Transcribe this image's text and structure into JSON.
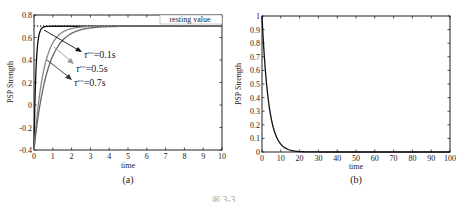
{
  "chart_data": [
    {
      "panel": "(a)",
      "type": "line",
      "title": "",
      "xlabel": "time",
      "ylabel": "PSP Strength",
      "xlim": [
        0,
        10
      ],
      "ylim": [
        -0.4,
        0.8
      ],
      "xticks": [
        "0",
        "1",
        "2",
        "3",
        "4",
        "5",
        "6",
        "7",
        "8",
        "9",
        "10"
      ],
      "yticks": [
        "-0.4",
        "-0.2",
        "0",
        "0.2",
        "0.4",
        "0.6",
        "0.8"
      ],
      "grid": false,
      "reference_line": {
        "label": "resting value",
        "y": 0.7,
        "style": "dotted"
      },
      "series": [
        {
          "name": "τ^rec=0.1s",
          "color": "#111111",
          "start": -0.4,
          "end": 0.7,
          "tau": 0.1
        },
        {
          "name": "τ^rec=0.5s",
          "color": "#888888",
          "start": -0.4,
          "end": 0.7,
          "tau": 0.5
        },
        {
          "name": "τ^rec=0.7s",
          "color": "#666666",
          "start": -0.4,
          "end": 0.7,
          "tau": 0.7
        }
      ],
      "annotations": [
        {
          "text": "τ^rec=0.1s"
        },
        {
          "text": "τ^rec=0.5s"
        },
        {
          "text": "τ^rec=0.7s"
        }
      ]
    },
    {
      "panel": "(b)",
      "type": "line",
      "title": "",
      "xlabel": "time",
      "ylabel": "PSP Strength",
      "xlim": [
        0,
        100
      ],
      "ylim": [
        0,
        1
      ],
      "xticks": [
        "0",
        "10",
        "20",
        "30",
        "40",
        "50",
        "60",
        "70",
        "80",
        "90",
        "100"
      ],
      "yticks": [
        "0",
        "0.1",
        "0.2",
        "0.3",
        "0.4",
        "0.5",
        "0.6",
        "0.7",
        "0.8",
        "0.9",
        "1"
      ],
      "grid": false,
      "series": [
        {
          "name": "decay",
          "color": "#111111",
          "start": 1.0,
          "end": 0.0,
          "tau": 3.5
        }
      ]
    }
  ],
  "labels": {
    "panel_a": "(a)",
    "panel_b": "(b)",
    "xlabel": "time",
    "ylabel": "PSP Strength",
    "resting": "resting value",
    "anno1_base": "τ",
    "anno1_sup": "rec",
    "anno1_val": "=0.1s",
    "anno2_val": "=0.5s",
    "anno3_val": "=0.7s",
    "caption": "图 3-3"
  }
}
